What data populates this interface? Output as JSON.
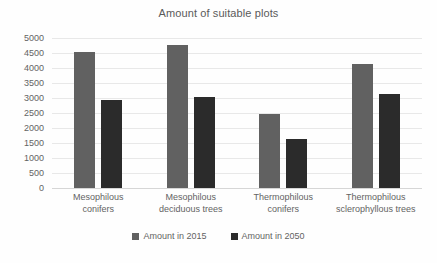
{
  "chart_data": {
    "type": "bar",
    "title": "Amount of suitable plots",
    "xlabel": "",
    "ylabel": "",
    "ylim": [
      0,
      5000
    ],
    "ytick_step": 500,
    "yticks": [
      "5000",
      "4500",
      "4000",
      "3500",
      "3000",
      "2500",
      "2000",
      "1500",
      "1000",
      "500",
      "0"
    ],
    "grid": true,
    "legend_position": "bottom",
    "categories": [
      "Mesophilous conifers",
      "Mesophilous deciduous trees",
      "Thermophilous conifers",
      "Thermophilous sclerophyllous trees"
    ],
    "category_lines": [
      [
        "Mesophilous",
        "conifers"
      ],
      [
        "Mesophilous",
        "deciduous trees"
      ],
      [
        "Thermophilous",
        "conifers"
      ],
      [
        "Thermophilous",
        "sclerophyllous trees"
      ]
    ],
    "series": [
      {
        "name": "Amount in 2015",
        "color": "#616161",
        "values": [
          4530,
          4760,
          2460,
          4140
        ]
      },
      {
        "name": "Amount in 2050",
        "color": "#2b2b2b",
        "values": [
          2920,
          3040,
          1650,
          3140
        ]
      }
    ]
  },
  "legend": {
    "items": [
      {
        "label": "Amount in 2015"
      },
      {
        "label": "Amount in 2050"
      }
    ]
  },
  "colors": {
    "series_2015": "#616161",
    "series_2050": "#2b2b2b",
    "gridline": "#e8e8e8",
    "text": "#636363",
    "background": "#fefefe"
  }
}
